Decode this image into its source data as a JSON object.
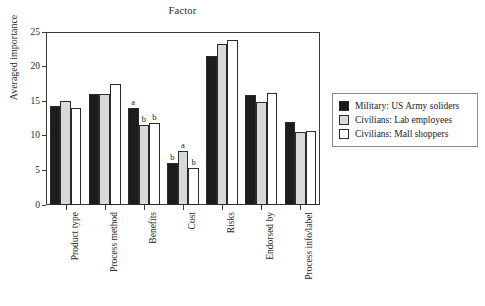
{
  "chart_data": {
    "type": "bar",
    "title": "Factor",
    "xlabel": "",
    "ylabel": "Averaged importance",
    "ylim": [
      0,
      25
    ],
    "yticks": [
      0,
      5,
      10,
      15,
      20,
      25
    ],
    "grid": false,
    "legend_position": "right",
    "categories": [
      "Product type",
      "Process method",
      "Benefits",
      "Cost",
      "Risks",
      "Endorsed by",
      "Process info/label"
    ],
    "series": [
      {
        "name": "Military: US Army soliders",
        "color": "#1c1c1c",
        "values": [
          14.3,
          16.1,
          14.0,
          6.0,
          21.5,
          15.9,
          12.0
        ],
        "annotations": [
          "",
          "",
          "a",
          "b",
          "",
          "",
          ""
        ]
      },
      {
        "name": "Civilians: Lab employees",
        "color": "#d9d9d9",
        "values": [
          15.1,
          16.0,
          11.6,
          7.8,
          23.2,
          14.9,
          10.6
        ],
        "annotations": [
          "",
          "",
          "b",
          "a",
          "",
          "",
          ""
        ]
      },
      {
        "name": "Civilians: Mall shoppers",
        "color": "#ffffff",
        "values": [
          14.0,
          17.5,
          11.8,
          5.4,
          23.9,
          16.2,
          10.7
        ],
        "annotations": [
          "",
          "",
          "b",
          "b",
          "",
          "",
          ""
        ]
      }
    ]
  },
  "legend": {
    "items": [
      {
        "label": "Military: US Army soliders",
        "swatch": "black-filled-swatch"
      },
      {
        "label": "Civilians: Lab employees",
        "swatch": "gray-filled-swatch"
      },
      {
        "label": "Civilians: Mall shoppers",
        "swatch": "white-empty-swatch"
      }
    ]
  }
}
